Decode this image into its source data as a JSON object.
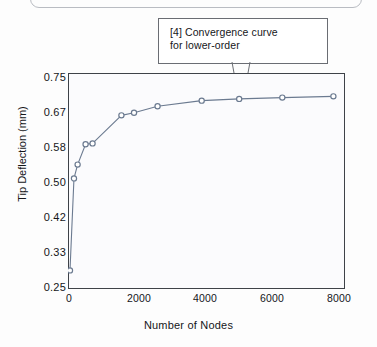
{
  "callout": {
    "name": "convergence-callout",
    "line1": "[4] Convergence curve",
    "line2": "for lower-order"
  },
  "chart_data": {
    "type": "line",
    "title": "",
    "xlabel": "Number of Nodes",
    "ylabel": "Tip Deflection (mm)",
    "xlim": [
      0,
      8350
    ],
    "ylim": [
      0.25,
      0.75
    ],
    "grid": false,
    "legend": null,
    "xticks": [
      0,
      2000,
      4000,
      6000,
      8000
    ],
    "xtick_labels": [
      "0",
      "2000",
      "4000",
      "6000",
      "8000"
    ],
    "yticks": [
      0.25,
      0.33,
      0.42,
      0.5,
      0.58,
      0.67,
      0.75
    ],
    "ytick_labels": [
      "0.25",
      "0.33",
      "0.42",
      "0.50",
      "0.58",
      "0.67",
      "0.75"
    ],
    "marker": "open-circle",
    "line_color": "#6b7a90",
    "marker_color": "#6b7a90",
    "series": [
      {
        "name": "Tip deflection convergence",
        "x": [
          60,
          180,
          290,
          530,
          740,
          1610,
          1990,
          2700,
          4030,
          5160,
          6460,
          8000
        ],
        "y": [
          0.293,
          0.506,
          0.538,
          0.585,
          0.587,
          0.652,
          0.658,
          0.673,
          0.686,
          0.69,
          0.693,
          0.696
        ]
      }
    ]
  }
}
